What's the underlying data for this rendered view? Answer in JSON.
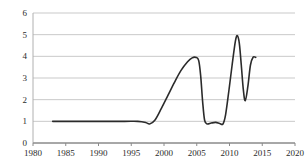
{
  "chart_data": {
    "type": "line",
    "title": "",
    "subtitle": "",
    "xlabel": "",
    "ylabel": "",
    "xlim": [
      1980,
      2020
    ],
    "ylim": [
      0,
      6
    ],
    "grid": true,
    "grid_axis": "y",
    "legend": false,
    "legend_position": "none",
    "x_ticks": [
      1980,
      1985,
      1990,
      1995,
      2000,
      2005,
      2010,
      2015,
      2020
    ],
    "x_tick_labels": [
      "1980",
      "1985",
      "1990",
      "1995",
      "2000",
      "2005",
      "2010",
      "2015",
      "2020"
    ],
    "y_ticks": [
      0,
      1,
      2,
      3,
      4,
      5,
      6
    ],
    "y_tick_labels": [
      "0",
      "1",
      "2",
      "3",
      "4",
      "5",
      "6"
    ],
    "line_color": "#2b2b2b",
    "line_width": 1.6,
    "series": [
      {
        "name": "series-1",
        "x": [
          1983.0,
          1985.0,
          1990.0,
          1994.0,
          1996.0,
          1997.2,
          1997.8,
          1998.6,
          1999.6,
          2000.6,
          2001.6,
          2002.6,
          2003.6,
          2004.3,
          2004.9,
          2005.3,
          2005.6,
          2005.9,
          2006.2,
          2006.6,
          2007.2,
          2007.9,
          2008.5,
          2009.0,
          2009.4,
          2009.9,
          2010.4,
          2010.9,
          2011.2,
          2011.5,
          2011.8,
          2012.1,
          2012.4,
          2012.8,
          2013.2,
          2013.6,
          2014.0
        ],
        "y": [
          1.0,
          1.0,
          1.0,
          1.0,
          1.0,
          0.95,
          0.88,
          1.05,
          1.6,
          2.2,
          2.8,
          3.35,
          3.75,
          3.93,
          3.95,
          3.8,
          3.1,
          1.9,
          1.05,
          0.88,
          0.92,
          0.95,
          0.9,
          0.88,
          1.3,
          2.4,
          3.6,
          4.7,
          4.95,
          4.6,
          3.6,
          2.5,
          1.95,
          2.6,
          3.6,
          3.96,
          3.95
        ]
      }
    ]
  },
  "axis": {
    "y_axis_name": "value-axis",
    "x_axis_name": "year-axis"
  }
}
